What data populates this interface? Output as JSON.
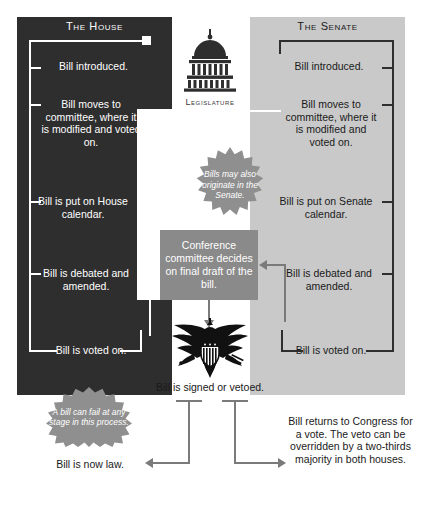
{
  "house": {
    "title": "The House",
    "steps": [
      "Bill introduced.",
      "Bill moves to committee, where it is modified and voted on.",
      "Bill is put on House calendar.",
      "Bill is debated and amended.",
      "Bill is voted on."
    ]
  },
  "senate": {
    "title": "The Senate",
    "steps": [
      "Bill introduced.",
      "Bill moves to committee, where it is modified and voted on.",
      "Bill is put on Senate calendar.",
      "Bill is debated and amended.",
      "Bill is voted on."
    ]
  },
  "legislature": {
    "caption": "Legislature",
    "icon": "capitol-dome-icon"
  },
  "conference": {
    "text": "Conference committee decides on final draft of the bill."
  },
  "notes": [
    {
      "id": "origination",
      "text": "Bills may also originate in the Senate."
    },
    {
      "id": "failure",
      "text": "A bill can fail at any stage in this process."
    }
  ],
  "executive": {
    "icon": "eagle-seal-icon",
    "caption": "Bill is signed or vetoed."
  },
  "outcomes": {
    "law": "Bill is now law.",
    "veto": "Bill returns to Congress for a vote. The veto can be overridden by a two-thirds majority in both houses."
  },
  "colors": {
    "house_bg": "#2e2e2e",
    "senate_bg": "#c9c9c9",
    "conference_bg": "#8a8a8a",
    "burst_bg": "#8f8f8f",
    "connector": "#7a7a7a",
    "page_bg": "#ffffff"
  }
}
